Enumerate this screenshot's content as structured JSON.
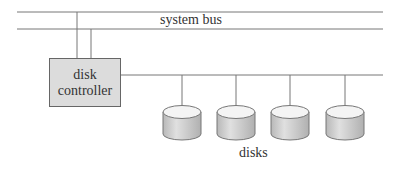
{
  "diagram": {
    "bus_label": "system bus",
    "controller": {
      "line1": "disk",
      "line2": "controller"
    },
    "disks_label": "disks",
    "disk_count": 4,
    "colors": {
      "line": "#777777",
      "controller_fill": "#dcdcdc",
      "disk_side": "#c8c8c8",
      "disk_top": "#f4f4f4"
    }
  }
}
